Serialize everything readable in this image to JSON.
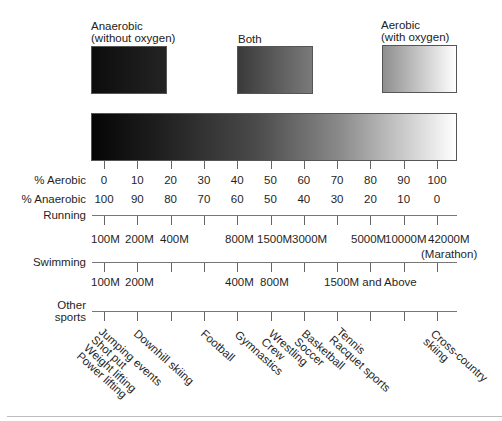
{
  "categories": {
    "anaerobic": {
      "line1": "Anaerobic",
      "line2": "(without oxygen)"
    },
    "both": {
      "line1": "Both"
    },
    "aerobic": {
      "line1": "Aerobic",
      "line2": "(with oxygen)"
    }
  },
  "scale": {
    "aerobic_label": "% Aerobic",
    "anaerobic_label": "% Anaerobic",
    "aerobic_values": [
      "0",
      "10",
      "20",
      "30",
      "40",
      "50",
      "60",
      "70",
      "80",
      "90",
      "100"
    ],
    "anaerobic_values": [
      "100",
      "90",
      "80",
      "70",
      "60",
      "50",
      "40",
      "30",
      "20",
      "10",
      "0"
    ]
  },
  "running": {
    "label": "Running",
    "distances": [
      "100M",
      "200M",
      "400M",
      "800M",
      "1500M",
      "3000M",
      "5000M",
      "10000M",
      "42000M"
    ],
    "marathon_note": "(Marathon)"
  },
  "swimming": {
    "label": "Swimming",
    "distances": [
      "100M",
      "200M",
      "400M",
      "800M",
      "1500M and Above"
    ]
  },
  "other_sports": {
    "label_line1": "Other",
    "label_line2": "sports",
    "groups": [
      {
        "name": "Jumping events\nShot put\nWeight lifting\nPower lifting"
      },
      {
        "name": "Downhill skiing"
      },
      {
        "name": "Football"
      },
      {
        "name": "Gymnastics"
      },
      {
        "name": "Wrestling\nCrew"
      },
      {
        "name": "Basketball\nSoccer"
      },
      {
        "name": "Tennis\nRacquet sports"
      },
      {
        "name": "Cross-country\nskiing"
      }
    ]
  },
  "chart_data": {
    "type": "table",
    "x": [
      0,
      10,
      20,
      30,
      40,
      50,
      60,
      70,
      80,
      90,
      100
    ],
    "xlabel": "% Aerobic",
    "secondary_xlabel": "% Anaerobic",
    "rows": {
      "Running": {
        "100M": 0,
        "200M": 10,
        "400M": 20,
        "800M": 40,
        "1500M": 50,
        "3000M": 60,
        "5000M": 75,
        "10000M": 85,
        "42000M (Marathon)": 95
      },
      "Swimming": {
        "100M": 0,
        "200M": 10,
        "400M": 40,
        "800M": 50,
        "1500M and Above": 75
      },
      "Other sports": {
        "Jumping events / Shot put / Weight lifting / Power lifting": 0,
        "Downhill skiing": 10,
        "Football": 30,
        "Gymnastics": 40,
        "Wrestling / Crew": 50,
        "Basketball / Soccer": 60,
        "Tennis / Racquet sports": 70,
        "Cross-country skiing": 95
      }
    }
  }
}
